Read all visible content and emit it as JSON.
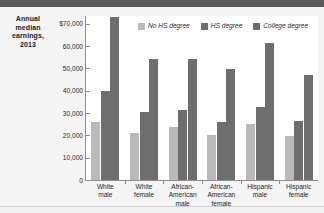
{
  "figure": {
    "axis_title": "Annual median earnings, 2013"
  },
  "colors": {
    "no_hs": "#b9b9b9",
    "hs": "#6e6e6e",
    "college": "#6e6e6e",
    "axis": "#8d8d8d",
    "banner": "#5a5a5c",
    "plot_bg": "#ffffff",
    "page_bg": "#f2f2f2"
  },
  "chart_data": {
    "type": "bar",
    "title": "Annual median earnings, 2013",
    "xlabel": "",
    "ylabel": "Annual median earnings, 2013",
    "ylim": [
      0,
      73500
    ],
    "grid": false,
    "legend_position": "top-right",
    "categories": [
      "White male",
      "White female",
      "African-American male",
      "African-American female",
      "Hispanic male",
      "Hispanic female"
    ],
    "category_lines": [
      [
        "White",
        "male"
      ],
      [
        "White",
        "female"
      ],
      [
        "African-",
        "American",
        "male"
      ],
      [
        "African-",
        "American",
        "female"
      ],
      [
        "Hispanic",
        "male"
      ],
      [
        "Hispanic",
        "female"
      ]
    ],
    "ytick_values": [
      0,
      10000,
      20000,
      30000,
      40000,
      50000,
      60000,
      70000
    ],
    "ytick_labels": [
      "0",
      "10,000",
      "20,000",
      "30,000",
      "40,000",
      "50,000",
      "60,000",
      "$70,000"
    ],
    "series": [
      {
        "name": "No HS degree",
        "color": "#b9b9b9",
        "values": [
          26200,
          21000,
          23700,
          20300,
          24900,
          19600
        ]
      },
      {
        "name": "HS degree",
        "color": "#6e6e6e",
        "values": [
          39800,
          30600,
          31200,
          26200,
          32600,
          26400
        ]
      },
      {
        "name": "College degree",
        "color": "#6e6e6e",
        "values": [
          73200,
          54200,
          54200,
          49900,
          61400,
          47100
        ]
      }
    ]
  }
}
